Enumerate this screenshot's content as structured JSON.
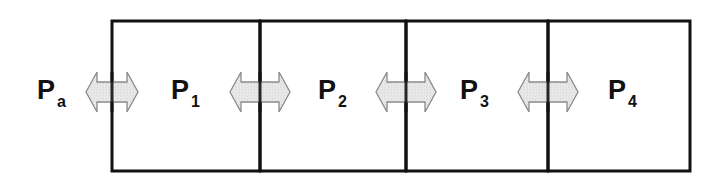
{
  "diagram": {
    "type": "compartment-chain",
    "compartments": [
      {
        "id": "P1",
        "symbol": "P",
        "subscript": "1"
      },
      {
        "id": "P2",
        "symbol": "P",
        "subscript": "2"
      },
      {
        "id": "P3",
        "symbol": "P",
        "subscript": "3"
      },
      {
        "id": "P4",
        "symbol": "P",
        "subscript": "4"
      }
    ],
    "external": {
      "id": "Pa",
      "symbol": "P",
      "subscript": "a"
    },
    "exchanges": [
      {
        "between": [
          "Pa",
          "P1"
        ],
        "icon": "double-arrow-icon"
      },
      {
        "between": [
          "P1",
          "P2"
        ],
        "icon": "double-arrow-icon"
      },
      {
        "between": [
          "P2",
          "P3"
        ],
        "icon": "double-arrow-icon"
      },
      {
        "between": [
          "P3",
          "P4"
        ],
        "icon": "double-arrow-icon"
      }
    ],
    "colors": {
      "border": "#111111",
      "arrow_fill": "#e6e6e6",
      "arrow_stroke": "#8a8a8a",
      "text": "#111111"
    }
  }
}
